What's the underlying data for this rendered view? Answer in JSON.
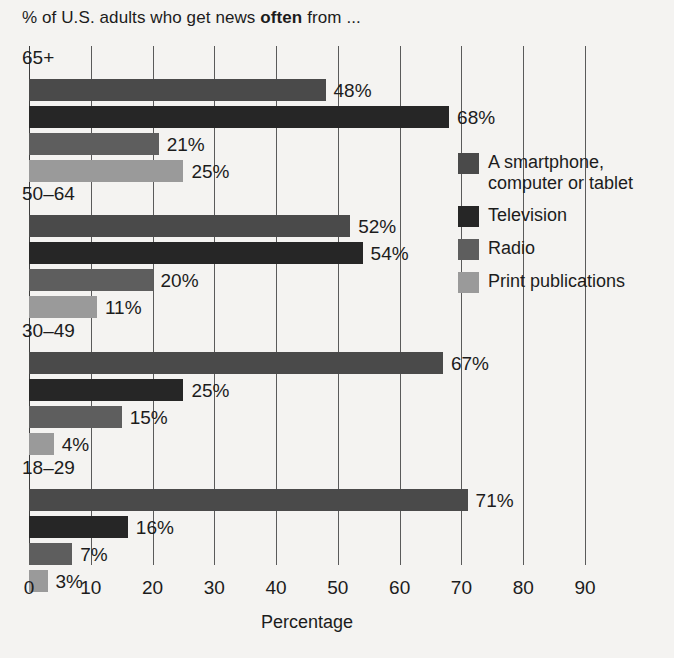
{
  "chart_data": {
    "type": "bar",
    "orientation": "horizontal",
    "title": "% of U.S. adults who get news often from ...",
    "title_plain": "% of U.S. adults who get news ",
    "title_emphasis": "often",
    "title_tail": " from ...",
    "xlabel": "Percentage",
    "ylabel": "",
    "xlim": [
      0,
      90
    ],
    "xticks": [
      0,
      10,
      20,
      30,
      40,
      50,
      60,
      70,
      80,
      90
    ],
    "xtick_labels": [
      "0",
      "10",
      "20",
      "30",
      "40",
      "50",
      "60",
      "70",
      "80",
      "90"
    ],
    "grid": true,
    "legend_position": "right",
    "categories": [
      "65+",
      "50–64",
      "30–49",
      "18–29"
    ],
    "series": [
      {
        "name": "A smartphone, computer or tablet",
        "color": "#4a4a4a",
        "values": [
          48,
          52,
          67,
          71
        ],
        "labels": [
          "48%",
          "52%",
          "67%",
          "71%"
        ]
      },
      {
        "name": "Television",
        "color": "#262626",
        "values": [
          68,
          54,
          25,
          16
        ],
        "labels": [
          "68%",
          "54%",
          "25%",
          "16%"
        ]
      },
      {
        "name": "Radio",
        "color": "#5e5e5e",
        "values": [
          21,
          20,
          15,
          7
        ],
        "labels": [
          "21%",
          "20%",
          "15%",
          "7%"
        ]
      },
      {
        "name": "Print publications",
        "color": "#9a9a9a",
        "values": [
          25,
          11,
          4,
          3
        ],
        "labels": [
          "25%",
          "11%",
          "4%",
          "3%"
        ]
      }
    ],
    "groups": [
      {
        "label": "65+",
        "bars": [
          {
            "series": "A smartphone, computer or tablet",
            "value": 48,
            "label": "48%",
            "color": "#4a4a4a"
          },
          {
            "series": "Television",
            "value": 68,
            "label": "68%",
            "color": "#262626"
          },
          {
            "series": "Radio",
            "value": 21,
            "label": "21%",
            "color": "#5e5e5e"
          },
          {
            "series": "Print publications",
            "value": 25,
            "label": "25%",
            "color": "#9a9a9a"
          }
        ]
      },
      {
        "label": "50–64",
        "bars": [
          {
            "series": "A smartphone, computer or tablet",
            "value": 52,
            "label": "52%",
            "color": "#4a4a4a"
          },
          {
            "series": "Television",
            "value": 54,
            "label": "54%",
            "color": "#262626"
          },
          {
            "series": "Radio",
            "value": 20,
            "label": "20%",
            "color": "#5e5e5e"
          },
          {
            "series": "Print publications",
            "value": 11,
            "label": "11%",
            "color": "#9a9a9a"
          }
        ]
      },
      {
        "label": "30–49",
        "bars": [
          {
            "series": "A smartphone, computer or tablet",
            "value": 67,
            "label": "67%",
            "color": "#4a4a4a"
          },
          {
            "series": "Television",
            "value": 25,
            "label": "25%",
            "color": "#262626"
          },
          {
            "series": "Radio",
            "value": 15,
            "label": "15%",
            "color": "#5e5e5e"
          },
          {
            "series": "Print publications",
            "value": 4,
            "label": "4%",
            "color": "#9a9a9a"
          }
        ]
      },
      {
        "label": "18–29",
        "bars": [
          {
            "series": "A smartphone, computer or tablet",
            "value": 71,
            "label": "71%",
            "color": "#4a4a4a"
          },
          {
            "series": "Television",
            "value": 16,
            "label": "16%",
            "color": "#262626"
          },
          {
            "series": "Radio",
            "value": 7,
            "label": "7%",
            "color": "#5e5e5e"
          },
          {
            "series": "Print publications",
            "value": 3,
            "label": "3%",
            "color": "#9a9a9a"
          }
        ]
      }
    ],
    "legend": [
      {
        "label": "A smartphone, computer or tablet",
        "color": "#4a4a4a"
      },
      {
        "label": "Television",
        "color": "#262626"
      },
      {
        "label": "Radio",
        "color": "#5e5e5e"
      },
      {
        "label": "Print publications",
        "color": "#9a9a9a"
      }
    ]
  },
  "colors": {
    "background": "#f4f3f1",
    "text": "#1c1c1c",
    "gridline": "#5a5a5a"
  }
}
